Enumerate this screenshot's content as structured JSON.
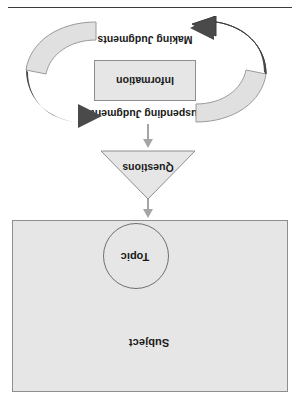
{
  "figure": {
    "orientation_note": "upside-down",
    "subject": {
      "label": "Subject",
      "topic_label": "Topic"
    },
    "questions": {
      "label": "Questions"
    },
    "cycle": {
      "suspending_label": "Suspending Judgments",
      "information_label": "Information",
      "making_label": "Making Judgments"
    },
    "icons": {
      "arrow_up_subject": "arrow-up-icon",
      "arrow_up_questions": "arrow-up-icon",
      "cycle_arrow_left": "curved-arrow-icon",
      "cycle_arrow_right": "curved-arrow-icon"
    },
    "colors": {
      "fill_light": "#e6e6e6",
      "stroke": "#8e8e8e",
      "arrow_dark": "#4a4a4a",
      "arrow_light": "#e0e0e0",
      "connector": "#a5a5a5",
      "text": "#1a1a1a",
      "rule": "#3b3b3b"
    }
  }
}
